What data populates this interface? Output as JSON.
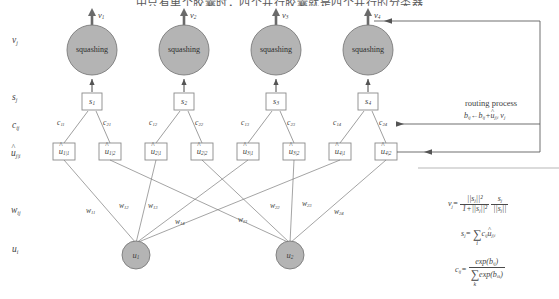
{
  "page": {
    "top_partial_text": "中只有单个胶囊时，四个并行胶囊就是四个并行的分类器",
    "width": 559,
    "height": 299
  },
  "row_labels": [
    {
      "id": "v-row",
      "base": "v",
      "sub": "j",
      "x": 14,
      "y": 40
    },
    {
      "id": "s-row",
      "base": "s",
      "sub": "j",
      "x": 14,
      "y": 96
    },
    {
      "id": "c-row",
      "base": "c",
      "sub": "ij",
      "x": 14,
      "y": 124
    },
    {
      "id": "uhat-row",
      "base": "u",
      "sub": "j|i",
      "hat": true,
      "x": 13,
      "y": 152
    },
    {
      "id": "w-row",
      "base": "w",
      "sub": "ij",
      "x": 13,
      "y": 209
    },
    {
      "id": "u-row",
      "base": "u",
      "sub": "i",
      "x": 14,
      "y": 248
    }
  ],
  "capsules": [
    {
      "id": "cap1",
      "squash_label": "squashing",
      "v_label_base": "v",
      "v_label_sub": "1",
      "s_label_base": "s",
      "s_label_sub": "1",
      "cx": 92
    },
    {
      "id": "cap2",
      "squash_label": "squashing",
      "v_label_base": "v",
      "v_label_sub": "2",
      "s_label_base": "s",
      "s_label_sub": "2",
      "cx": 184
    },
    {
      "id": "cap3",
      "squash_label": "squashing",
      "v_label_base": "v",
      "v_label_sub": "3",
      "s_label_base": "s",
      "s_label_sub": "3",
      "cx": 276
    },
    {
      "id": "cap4",
      "squash_label": "squashing",
      "v_label_base": "v",
      "v_label_sub": "4",
      "s_label_base": "s",
      "s_label_sub": "4",
      "cx": 368
    }
  ],
  "coupling_labels": [
    {
      "id": "c11",
      "base": "c",
      "sub": "11",
      "x": 62,
      "y": 124
    },
    {
      "id": "c21",
      "base": "c",
      "sub": "21",
      "x": 106,
      "y": 124
    },
    {
      "id": "c12",
      "base": "c",
      "sub": "12",
      "x": 154,
      "y": 124
    },
    {
      "id": "c22",
      "base": "c",
      "sub": "22",
      "x": 198,
      "y": 124
    },
    {
      "id": "c13",
      "base": "c",
      "sub": "13",
      "x": 246,
      "y": 124
    },
    {
      "id": "c23",
      "base": "c",
      "sub": "23",
      "x": 290,
      "y": 124
    },
    {
      "id": "c14",
      "base": "c",
      "sub": "14",
      "x": 338,
      "y": 124
    },
    {
      "id": "c24",
      "base": "c",
      "sub": "24",
      "x": 382,
      "y": 124
    }
  ],
  "uhat_boxes": [
    {
      "id": "uhat11",
      "base": "u",
      "sub": "1|1",
      "cx": 64
    },
    {
      "id": "uhat12",
      "base": "u",
      "sub": "1|2",
      "cx": 110
    },
    {
      "id": "uhat21",
      "base": "u",
      "sub": "2|1",
      "cx": 156
    },
    {
      "id": "uhat22",
      "base": "u",
      "sub": "2|2",
      "cx": 202
    },
    {
      "id": "uhat31",
      "base": "u",
      "sub": "3|1",
      "cx": 248
    },
    {
      "id": "uhat32",
      "base": "u",
      "sub": "3|2",
      "cx": 294
    },
    {
      "id": "uhat41",
      "base": "u",
      "sub": "4|1",
      "cx": 340
    },
    {
      "id": "uhat42",
      "base": "u",
      "sub": "4|2",
      "cx": 386
    }
  ],
  "weight_labels": [
    {
      "id": "w11",
      "base": "w",
      "sub": "11",
      "x": 88,
      "y": 210
    },
    {
      "id": "w12",
      "base": "w",
      "sub": "12",
      "x": 121,
      "y": 205
    },
    {
      "id": "w13",
      "base": "w",
      "sub": "13",
      "x": 150,
      "y": 205
    },
    {
      "id": "w14",
      "base": "w",
      "sub": "14",
      "x": 177,
      "y": 221
    },
    {
      "id": "w21",
      "base": "w",
      "sub": "21",
      "x": 240,
      "y": 219
    },
    {
      "id": "w22",
      "base": "w",
      "sub": "22",
      "x": 272,
      "y": 205
    },
    {
      "id": "w23",
      "base": "w",
      "sub": "23",
      "x": 304,
      "y": 203
    },
    {
      "id": "w24",
      "base": "w",
      "sub": "24",
      "x": 336,
      "y": 211
    }
  ],
  "input_nodes": [
    {
      "id": "u1",
      "base": "u",
      "sub": "1",
      "cx": 136,
      "cy": 255
    },
    {
      "id": "u2",
      "base": "u",
      "sub": "2",
      "cx": 290,
      "cy": 255
    }
  ],
  "routing_panel": {
    "title": "routing process",
    "update_rule": {
      "lhs_base": "b",
      "lhs_sub": "ij",
      "arrow": "←",
      "rhs_base": "b",
      "rhs_sub": "ij",
      "plus": "+",
      "term_base": "u",
      "term_sub": "j|i",
      "term_hat": true,
      "dot_base": "v",
      "dot_sub": "j"
    }
  },
  "formulas": {
    "squash": {
      "lhs_base": "v",
      "lhs_sub": "j",
      "eq": "=",
      "f1_num": "||s",
      "f1_num_sub": "j",
      "f1_num_tail": "||²",
      "f1_den_lead": "1+||s",
      "f1_den_sub": "j",
      "f1_den_tail": "||²",
      "f2_num": "s",
      "f2_num_sub": "j",
      "f2_den": "||s",
      "f2_den_sub": "j",
      "f2_den_tail": "||"
    },
    "sum": {
      "lhs_base": "s",
      "lhs_sub": "j",
      "eq": "=",
      "sigma": "∑",
      "sigma_lim": "i",
      "c_base": "c",
      "c_sub": "ij",
      "u_base": "u",
      "u_sub": "j|i"
    },
    "softmax": {
      "lhs_base": "c",
      "lhs_sub": "ij",
      "eq": "=",
      "num": "exp(",
      "num_base": "b",
      "num_sub": "ij",
      "num_tail": ")",
      "den_sigma": "∑",
      "den_lim": "k",
      "den_exp": "exp(",
      "den_base": "b",
      "den_sub": "ik",
      "den_tail": ")"
    }
  },
  "colors": {
    "stroke": "#6e6e6e",
    "arrow_dark": "#545454",
    "circle_fill": "#b4b4b4",
    "circle_stroke": "#7a7a7a",
    "box_stroke": "#8a8a8a",
    "text": "#3f3f3f",
    "background": "#ffffff"
  }
}
